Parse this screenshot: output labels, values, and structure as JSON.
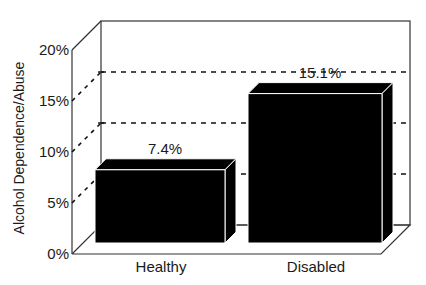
{
  "chart_data": {
    "type": "bar",
    "style": "3d",
    "title": "",
    "xlabel": "",
    "ylabel": "Alcohol Dependence/Abuse",
    "categories": [
      "Healthy",
      "Disabled"
    ],
    "values": [
      7.4,
      15.1
    ],
    "value_labels": [
      "7.4%",
      "15.1%"
    ],
    "ylim": [
      0,
      20
    ],
    "yticks": [
      0,
      5,
      10,
      15,
      20
    ],
    "ytick_labels": [
      "0%",
      "5%",
      "10%",
      "15%",
      "20%"
    ],
    "grid": true,
    "grid_style": "dashed",
    "legend": null,
    "bar_color": "#000000"
  }
}
